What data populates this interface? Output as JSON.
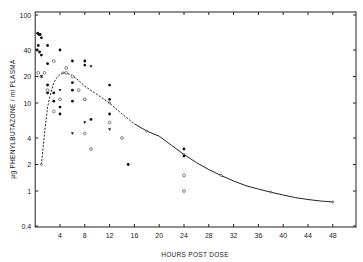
{
  "chart_data": {
    "type": "scatter",
    "title": "",
    "xlabel": "HOURS POST DOSE",
    "ylabel": "µg PHENYLBUTAZONE / ml PLASMA",
    "xlim": [
      0,
      51.7
    ],
    "ylim": [
      0.4,
      100
    ],
    "yscale": "log",
    "grid": false,
    "x_ticks": [
      4,
      8,
      12,
      16,
      20,
      24,
      28,
      32,
      36,
      40,
      44,
      48
    ],
    "x_tick_labels": [
      "4",
      "8",
      "12",
      "16",
      "20",
      "24",
      "28",
      "32",
      "36",
      "40",
      "44",
      "48"
    ],
    "y_ticks": [
      0.4,
      1,
      2,
      4,
      10,
      20,
      40,
      100
    ],
    "y_tick_labels": [
      "0.4",
      "1",
      "2",
      "4",
      "10",
      "20",
      "40",
      "100"
    ],
    "series": [
      {
        "name": "mean curve (dashed segment)",
        "style": "dashed",
        "x": [
          1,
          1.5,
          2,
          2.5,
          3,
          3.5,
          4,
          4.5,
          5,
          6,
          7,
          8,
          10,
          12,
          14,
          16
        ],
        "y": [
          2,
          4.5,
          9,
          13,
          17,
          19.5,
          21,
          22,
          22,
          20.5,
          18,
          15.5,
          12.5,
          10,
          7.5,
          5.8
        ]
      },
      {
        "name": "mean curve (solid segment)",
        "style": "solid",
        "x": [
          16,
          18,
          20,
          22,
          24,
          26,
          28,
          30,
          32,
          34,
          36,
          38,
          40,
          42,
          44,
          46,
          48
        ],
        "y": [
          5.8,
          4.8,
          4.2,
          3.3,
          2.6,
          2.1,
          1.75,
          1.5,
          1.3,
          1.15,
          1.05,
          0.97,
          0.9,
          0.84,
          0.8,
          0.77,
          0.75
        ]
      },
      {
        "name": "individual observations (filled)",
        "marker": "filled",
        "x": [
          0.4,
          0.6,
          0.8,
          1.0,
          0.5,
          0.3,
          0.7,
          1.0,
          2.0,
          2.0,
          2.0,
          2.0,
          3.0,
          3.0,
          4.0,
          4.0,
          4.0,
          6.0,
          6.0,
          6.0,
          6.0,
          8.0,
          8.0,
          8.0,
          9.0,
          12.0,
          12.0,
          12.0,
          15.0,
          24.0,
          24.0
        ],
        "y": [
          62,
          60,
          60,
          55,
          45,
          40,
          38,
          35,
          28,
          45,
          16,
          13,
          13,
          10.5,
          9,
          7.5,
          40,
          30,
          17,
          10.5,
          14,
          30,
          27,
          11,
          6.5,
          16,
          11,
          7.5,
          2,
          3,
          2.5
        ]
      },
      {
        "name": "individual observations (open)",
        "marker": "open",
        "x": [
          0.5,
          1.0,
          1.5,
          2.0,
          3.0,
          3.0,
          4.0,
          5.0,
          5.0,
          6.0,
          7.0,
          8.0,
          8.0,
          9.0,
          12.0,
          14.0,
          24.0,
          24.0
        ],
        "y": [
          22,
          20,
          22,
          14,
          30,
          8,
          11,
          22,
          25,
          20,
          14,
          11,
          4.5,
          3,
          6,
          4,
          1.5,
          1
        ]
      },
      {
        "name": "individual observations (triangle)",
        "marker": "triangle",
        "x": [
          1.0,
          2.0,
          4.0,
          6.0,
          8.0,
          9.0,
          12.0
        ],
        "y": [
          20,
          16,
          14,
          4.5,
          6,
          26,
          5
        ]
      }
    ],
    "annotations": []
  }
}
